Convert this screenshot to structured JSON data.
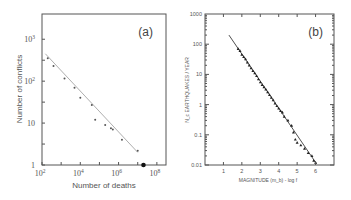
{
  "chart_data": [
    {
      "type": "scatter",
      "panel_label": "(a)",
      "title": "",
      "xlabel": "Number of deaths",
      "ylabel": "Number of conflicts",
      "xscale": "log",
      "yscale": "log",
      "xlim": [
        100,
        300000000
      ],
      "ylim": [
        1,
        4000
      ],
      "xticks": [
        {
          "v": 100,
          "base": "10",
          "exp": "2"
        },
        {
          "v": 10000,
          "base": "10",
          "exp": "4"
        },
        {
          "v": 1000000,
          "base": "10",
          "exp": "6"
        },
        {
          "v": 100000000,
          "base": "10",
          "exp": "8"
        }
      ],
      "yticks": [
        {
          "v": 1,
          "label": "1"
        },
        {
          "v": 10,
          "label": "10"
        },
        {
          "v": 100,
          "base": "10",
          "exp": "2"
        },
        {
          "v": 1000,
          "base": "10",
          "exp": "3"
        }
      ],
      "series": [
        {
          "name": "conflicts",
          "points": [
            [
              200,
              350
            ],
            [
              400,
              230
            ],
            [
              1500,
              115
            ],
            [
              5000,
              70
            ],
            [
              10000,
              40
            ],
            [
              40000,
              27
            ],
            [
              60000,
              12
            ],
            [
              200000,
              9
            ],
            [
              400000,
              7.5
            ],
            [
              500000,
              7
            ],
            [
              1500000,
              4
            ],
            [
              10000000,
              2.2
            ]
          ],
          "highlight": [
            [
              20000000,
              1
            ]
          ]
        }
      ],
      "fit_line": [
        [
          150,
          450
        ],
        [
          10000000,
          2
        ]
      ],
      "grid": false
    },
    {
      "type": "scatter",
      "panel_label": "(b)",
      "title": "",
      "xlabel": "MAGNITUDE (m_b) - log f",
      "ylabel": "N_c EARTHQUAKES / YEAR",
      "xscale": "linear",
      "yscale": "log",
      "xlim": [
        0,
        7
      ],
      "ylim": [
        0.01,
        1000
      ],
      "xticks": [
        {
          "v": 1,
          "label": "1"
        },
        {
          "v": 2,
          "label": "2"
        },
        {
          "v": 3,
          "label": "3"
        },
        {
          "v": 4,
          "label": "4"
        },
        {
          "v": 5,
          "label": "5"
        },
        {
          "v": 6,
          "label": "6"
        }
      ],
      "yticks": [
        {
          "v": 0.01,
          "label": "0.01"
        },
        {
          "v": 0.1,
          "label": "0.1"
        },
        {
          "v": 1,
          "label": "1"
        },
        {
          "v": 10,
          "label": "10"
        },
        {
          "v": 100,
          "label": "100"
        },
        {
          "v": 1000,
          "label": "1000"
        }
      ],
      "series": [
        {
          "name": "earthquakes",
          "points": [
            [
              1.8,
              70
            ],
            [
              1.9,
              60
            ],
            [
              2.0,
              45
            ],
            [
              2.1,
              38
            ],
            [
              2.2,
              32
            ],
            [
              2.3,
              25
            ],
            [
              2.4,
              20
            ],
            [
              2.5,
              16
            ],
            [
              2.6,
              13
            ],
            [
              2.7,
              11
            ],
            [
              2.8,
              9
            ],
            [
              2.9,
              7
            ],
            [
              3.0,
              5.5
            ],
            [
              3.1,
              4.5
            ],
            [
              3.2,
              3.8
            ],
            [
              3.3,
              3.2
            ],
            [
              3.4,
              2.6
            ],
            [
              3.5,
              2.1
            ],
            [
              3.6,
              1.7
            ],
            [
              3.7,
              1.4
            ],
            [
              3.8,
              1.1
            ],
            [
              3.9,
              0.9
            ],
            [
              4.0,
              0.75
            ],
            [
              4.1,
              0.62
            ],
            [
              4.2,
              0.55
            ],
            [
              4.3,
              0.4
            ],
            [
              4.5,
              0.3
            ],
            [
              4.7,
              0.2
            ],
            [
              4.8,
              0.12
            ],
            [
              4.9,
              0.07
            ],
            [
              5.0,
              0.055
            ],
            [
              5.2,
              0.045
            ],
            [
              5.4,
              0.035
            ],
            [
              5.6,
              0.025
            ],
            [
              5.8,
              0.02
            ],
            [
              5.9,
              0.014
            ],
            [
              6.0,
              0.012
            ]
          ],
          "highlight": []
        }
      ],
      "fit_line": [
        [
          1.3,
          200
        ],
        [
          6.05,
          0.011
        ]
      ],
      "grid": false
    }
  ]
}
